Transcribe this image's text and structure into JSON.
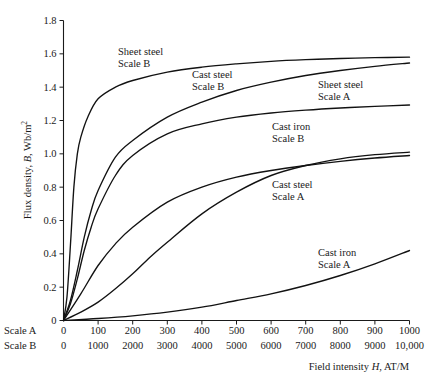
{
  "chart_data": {
    "type": "line",
    "title": "",
    "xlabel": "Field intensity H, AT/M",
    "ylabel": "Flux density, B, Wb/m2",
    "ylabel_main": "Flux density,",
    "ylabel_symbol": "B",
    "ylabel_unit": ", Wb/m",
    "ylabel_exp": "2",
    "xlabel_pre": "Field intensity ",
    "xlabel_symbol": "H",
    "xlabel_post": ", AT/M",
    "ylim": [
      0,
      1.8
    ],
    "ytick_labels": [
      "0",
      "0.2",
      "0.4",
      "0.6",
      "0.8",
      "1.0",
      "1.2",
      "1.4",
      "1.6",
      "1.8"
    ],
    "ytick_values": [
      0,
      0.2,
      0.4,
      0.6,
      0.8,
      1.0,
      1.2,
      1.4,
      1.6,
      1.8
    ],
    "grid": false,
    "legend_position": "inline-annotations",
    "x_axes": [
      {
        "name": "Scale A",
        "tick_labels": [
          "0",
          "100",
          "200",
          "300",
          "400",
          "500",
          "600",
          "700",
          "800",
          "900",
          "1000"
        ],
        "tick_values": [
          0,
          100,
          200,
          300,
          400,
          500,
          600,
          700,
          800,
          900,
          1000
        ],
        "xlim": [
          0,
          1000
        ]
      },
      {
        "name": "Scale B",
        "tick_labels": [
          "0",
          "1000",
          "2000",
          "3000",
          "4000",
          "5000",
          "6000",
          "7000",
          "8000",
          "9000",
          "10,000"
        ],
        "tick_values": [
          0,
          1000,
          2000,
          3000,
          4000,
          5000,
          6000,
          7000,
          8000,
          9000,
          10000
        ],
        "xlim": [
          0,
          10000
        ]
      }
    ],
    "series": [
      {
        "name": "Sheet steel Scale B",
        "label_line1": "Sheet steel",
        "label_line2": "Scale B",
        "scale": "B",
        "x": [
          0,
          100,
          200,
          300,
          400,
          500,
          700,
          1000,
          1500,
          2000,
          3000,
          4000,
          5000,
          6000,
          7000,
          8000,
          9000,
          10000
        ],
        "y": [
          0,
          0.14,
          0.45,
          0.8,
          1.0,
          1.1,
          1.22,
          1.33,
          1.4,
          1.44,
          1.49,
          1.52,
          1.54,
          1.555,
          1.565,
          1.572,
          1.577,
          1.58
        ]
      },
      {
        "name": "Cast steel Scale B",
        "label_line1": "Cast steel",
        "label_line2": "Scale B",
        "scale": "B",
        "x": [
          0,
          200,
          400,
          600,
          800,
          1000,
          1500,
          2000,
          3000,
          4000,
          5000,
          6000,
          7000,
          8000,
          9000,
          10000
        ],
        "y": [
          0,
          0.12,
          0.3,
          0.5,
          0.66,
          0.78,
          0.98,
          1.08,
          1.22,
          1.31,
          1.38,
          1.43,
          1.47,
          1.5,
          1.525,
          1.545
        ]
      },
      {
        "name": "Cast iron Scale B",
        "label_line1": "Cast iron",
        "label_line2": "Scale B",
        "scale": "B",
        "x": [
          0,
          500,
          1000,
          1500,
          2000,
          3000,
          4000,
          5000,
          6000,
          7000,
          8000,
          9000,
          10000
        ],
        "y": [
          0,
          0.16,
          0.33,
          0.46,
          0.56,
          0.71,
          0.8,
          0.86,
          0.9,
          0.93,
          0.955,
          0.975,
          0.99
        ]
      },
      {
        "name": "Sheet steel Scale A",
        "label_line1": "Sheet steel",
        "label_line2": "Scale A",
        "scale": "A",
        "x": [
          0,
          20,
          40,
          60,
          80,
          100,
          150,
          200,
          300,
          400,
          500,
          600,
          700,
          800,
          900,
          1000
        ],
        "y": [
          0,
          0.1,
          0.25,
          0.42,
          0.56,
          0.67,
          0.87,
          0.99,
          1.12,
          1.18,
          1.22,
          1.245,
          1.262,
          1.275,
          1.285,
          1.293
        ]
      },
      {
        "name": "Cast steel Scale A",
        "label_line1": "Cast steel",
        "label_line2": "Scale A",
        "scale": "A",
        "x": [
          0,
          50,
          100,
          150,
          200,
          250,
          300,
          400,
          500,
          600,
          700,
          800,
          900,
          1000
        ],
        "y": [
          0,
          0.05,
          0.11,
          0.19,
          0.28,
          0.38,
          0.47,
          0.64,
          0.77,
          0.87,
          0.93,
          0.97,
          0.995,
          1.01
        ]
      },
      {
        "name": "Cast iron Scale A",
        "label_line1": "Cast iron",
        "label_line2": "Scale A",
        "scale": "A",
        "x": [
          0,
          100,
          200,
          300,
          400,
          500,
          600,
          700,
          800,
          900,
          1000
        ],
        "y": [
          0,
          0.012,
          0.028,
          0.05,
          0.08,
          0.12,
          0.16,
          0.21,
          0.27,
          0.34,
          0.42
        ]
      }
    ],
    "annotations": [
      {
        "text_line1": "Sheet steel",
        "text_line2": "Scale B",
        "x_px": 118,
        "y_px": 55
      },
      {
        "text_line1": "Cast steel",
        "text_line2": "Scale B",
        "x_px": 192,
        "y_px": 78
      },
      {
        "text_line1": "Sheet steel",
        "text_line2": "Scale A",
        "x_px": 318,
        "y_px": 88
      },
      {
        "text_line1": "Cast iron",
        "text_line2": "Scale B",
        "x_px": 272,
        "y_px": 130
      },
      {
        "text_line1": "Cast steel",
        "text_line2": "Scale A",
        "x_px": 272,
        "y_px": 188
      },
      {
        "text_line1": "Cast iron",
        "text_line2": "Scale A",
        "x_px": 318,
        "y_px": 256
      }
    ]
  }
}
